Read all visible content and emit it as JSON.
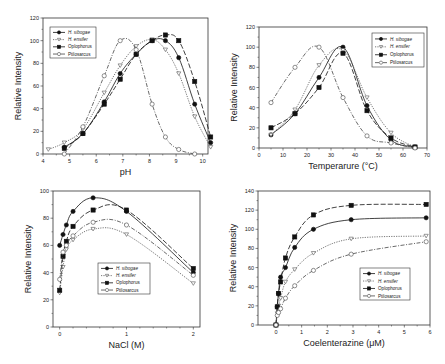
{
  "figure": {
    "background": "#ffffff"
  },
  "legend_labels": [
    "H. sibogae",
    "H. ensifer",
    "Oplophorus",
    "Ptilosarcus"
  ],
  "series_styles": [
    {
      "name": "H. sibogae",
      "marker": "circle",
      "filled": true,
      "dash": "none",
      "color": "#111111"
    },
    {
      "name": "H. ensifer",
      "marker": "triangle-down",
      "filled": false,
      "dash": "1.2,1.2",
      "color": "#555555"
    },
    {
      "name": "Oplophorus",
      "marker": "square",
      "filled": true,
      "dash": "5,2",
      "color": "#111111"
    },
    {
      "name": "Ptilosarcus",
      "marker": "circle",
      "filled": false,
      "dash": "4,1.5,1,1.5",
      "color": "#444444"
    }
  ],
  "chart_data": [
    {
      "id": "ph",
      "type": "line",
      "title": "",
      "xlabel": "pH",
      "ylabel": "Relative Intensity",
      "xlim": [
        4,
        10.2
      ],
      "ylim": [
        0,
        120
      ],
      "xticks": [
        4,
        5,
        6,
        7,
        8,
        9,
        10
      ],
      "yticks": [
        0,
        20,
        40,
        60,
        80,
        100,
        120
      ],
      "grid": false,
      "legend_position": "upper-left",
      "frame": {
        "left": 43,
        "right": 208,
        "top": 18,
        "bottom": 154
      },
      "legend_box": {
        "x": 50,
        "y": 27,
        "w": 46,
        "h": 31
      },
      "series": [
        {
          "name": "H. sibogae",
          "x": [
            4.8,
            5.5,
            6.3,
            6.9,
            7.5,
            8.1,
            8.6,
            9.1,
            9.7,
            10.3
          ],
          "y": [
            6,
            18,
            46,
            71,
            88,
            100,
            100,
            85,
            44,
            10
          ]
        },
        {
          "name": "H. ensifer",
          "x": [
            4.2,
            4.8,
            5.5,
            6.3,
            6.9,
            7.5,
            8.1,
            8.6,
            9.1,
            9.7,
            10.3
          ],
          "y": [
            4,
            10,
            22,
            54,
            78,
            95,
            101,
            92,
            71,
            33,
            6
          ]
        },
        {
          "name": "Oplophorus",
          "x": [
            4.8,
            5.5,
            6.3,
            6.9,
            7.5,
            8.1,
            8.6,
            9.1,
            9.7,
            10.3
          ],
          "y": [
            5,
            18,
            44,
            66,
            88,
            100,
            105,
            100,
            64,
            15
          ]
        },
        {
          "name": "Ptilosarcus",
          "x": [
            4.8,
            5.5,
            6.3,
            6.9,
            7.5,
            8.1,
            8.6,
            9.1,
            9.7
          ],
          "y": [
            0,
            24,
            69,
            100,
            92,
            44,
            15,
            4,
            0
          ]
        }
      ]
    },
    {
      "id": "temperature",
      "type": "line",
      "title": "",
      "xlabel": "Temperarure (°C)",
      "ylabel": "Relative Intensity",
      "xlim": [
        0,
        70
      ],
      "ylim": [
        0,
        120
      ],
      "xticks": [
        0,
        10,
        20,
        30,
        40,
        50,
        60,
        70
      ],
      "yticks": [
        0,
        20,
        40,
        60,
        80,
        100,
        120
      ],
      "grid": false,
      "legend_position": "upper-right",
      "frame": {
        "left": 259,
        "right": 427,
        "top": 27,
        "bottom": 148
      },
      "legend_box": {
        "x": 372,
        "y": 33,
        "w": 52,
        "h": 34
      },
      "series": [
        {
          "name": "H. sibogae",
          "x": [
            5,
            15,
            25,
            35,
            45,
            55,
            65
          ],
          "y": [
            13,
            34,
            70,
            100,
            42,
            8,
            1
          ]
        },
        {
          "name": "H. ensifer",
          "x": [
            5,
            15,
            25,
            35,
            45,
            55,
            65
          ],
          "y": [
            13,
            38,
            82,
            97,
            50,
            15,
            1
          ]
        },
        {
          "name": "Oplophorus",
          "x": [
            5,
            15,
            25,
            35,
            45,
            55,
            65
          ],
          "y": [
            20,
            34,
            60,
            94,
            37,
            10,
            1
          ]
        },
        {
          "name": "Ptilosarcus",
          "x": [
            5,
            15,
            25,
            35,
            45,
            55,
            65
          ],
          "y": [
            45,
            80,
            100,
            50,
            12,
            5,
            0
          ]
        }
      ]
    },
    {
      "id": "nacl",
      "type": "line",
      "title": "",
      "xlabel": "NaCl (M)",
      "ylabel": "Relative Intensity",
      "xlim": [
        -0.1,
        2.1
      ],
      "ylim": [
        0,
        100
      ],
      "xticks": [
        0,
        1,
        2
      ],
      "yticks": [
        0,
        20,
        40,
        60,
        80,
        100
      ],
      "grid": false,
      "legend_position": "center",
      "frame": {
        "left": 53,
        "right": 200,
        "top": 191,
        "bottom": 327
      },
      "legend_box": {
        "x": 98,
        "y": 263,
        "w": 52,
        "h": 31
      },
      "series": [
        {
          "name": "H. sibogae",
          "x": [
            0,
            0.05,
            0.1,
            0.2,
            0.5,
            1,
            2
          ],
          "y": [
            60,
            68,
            75,
            85,
            95,
            85,
            40
          ]
        },
        {
          "name": "H. ensifer",
          "x": [
            0,
            0.05,
            0.1,
            0.2,
            0.5,
            1,
            2
          ],
          "y": [
            25,
            44,
            57,
            64,
            72,
            68,
            32
          ]
        },
        {
          "name": "Oplophorus",
          "x": [
            0,
            0.05,
            0.1,
            0.2,
            0.5,
            1,
            2
          ],
          "y": [
            27,
            52,
            63,
            74,
            86,
            86,
            43
          ]
        },
        {
          "name": "Ptilosarcus",
          "x": [
            0,
            0.05,
            0.1,
            0.2,
            0.5,
            1,
            2
          ],
          "y": [
            35,
            55,
            60,
            67,
            77,
            75,
            38
          ]
        }
      ]
    },
    {
      "id": "coelenterazine",
      "type": "line",
      "title": "",
      "xlabel": "Coelenterazine (μM)",
      "ylabel": "Relative Intensity",
      "xlim": [
        -0.7,
        6
      ],
      "ylim": [
        0,
        140
      ],
      "xticks": [
        0,
        1,
        2,
        3,
        4,
        5,
        6
      ],
      "yticks": [
        0,
        20,
        40,
        60,
        80,
        100,
        120,
        140
      ],
      "grid": false,
      "legend_position": "lower-right",
      "frame": {
        "left": 258,
        "right": 430,
        "top": 191,
        "bottom": 325
      },
      "legend_box": {
        "x": 360,
        "y": 268,
        "w": 50,
        "h": 32
      },
      "series": [
        {
          "name": "H. sibogae",
          "x": [
            0,
            0.05,
            0.1,
            0.18,
            0.37,
            0.73,
            1.46,
            2.93,
            5.85
          ],
          "y": [
            0,
            19,
            33,
            50,
            60,
            81,
            100,
            110,
            112
          ]
        },
        {
          "name": "H. ensifer",
          "x": [
            0,
            0.05,
            0.1,
            0.18,
            0.37,
            0.73,
            1.46,
            2.93,
            5.85
          ],
          "y": [
            0,
            12,
            20,
            28,
            45,
            58,
            75,
            90,
            93
          ]
        },
        {
          "name": "Oplophorus",
          "x": [
            0,
            0.05,
            0.1,
            0.18,
            0.37,
            0.73,
            1.46,
            2.93,
            5.85
          ],
          "y": [
            0,
            19,
            33,
            45,
            70,
            92,
            115,
            125,
            126
          ]
        },
        {
          "name": "Ptilosarcus",
          "x": [
            0,
            0.05,
            0.1,
            0.18,
            0.37,
            0.73,
            1.46,
            2.93,
            5.85
          ],
          "y": [
            0,
            10,
            13,
            17,
            28,
            41,
            57,
            74,
            87
          ]
        }
      ]
    }
  ]
}
